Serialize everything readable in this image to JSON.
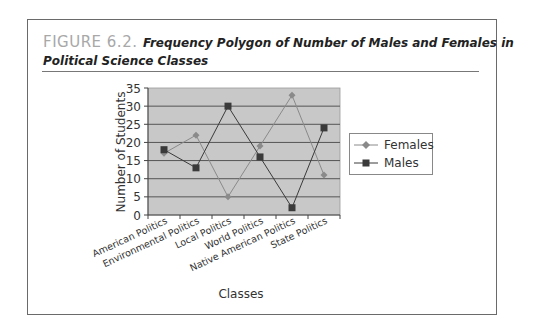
{
  "figure": {
    "label": "FIGURE 6.2.",
    "title_line1": "Frequency Polygon of Number of Males and Females in",
    "title_line2": "Political Science Classes"
  },
  "chart_data": {
    "type": "line",
    "xlabel": "Classes",
    "ylabel": "Number of Students",
    "categories": [
      "American Politics",
      "Environmental Politics",
      "Local Politics",
      "World Politics",
      "Native American Politics",
      "State Politics"
    ],
    "series": [
      {
        "name": "Females",
        "marker": "diamond",
        "values": [
          17,
          22,
          5,
          19,
          33,
          11
        ]
      },
      {
        "name": "Males",
        "marker": "square",
        "values": [
          18,
          13,
          30,
          16,
          2,
          24
        ]
      }
    ],
    "ylim": [
      0,
      35
    ],
    "yticks": [
      0,
      5,
      10,
      15,
      20,
      25,
      30,
      35
    ],
    "grid": true,
    "legend_position": "right"
  },
  "legend": {
    "females": "Females",
    "males": "Males"
  },
  "colors": {
    "plot_bg": "#c8c8c8",
    "grid": "#555555",
    "females": "#8a8a8a",
    "males": "#3a3a3a"
  }
}
